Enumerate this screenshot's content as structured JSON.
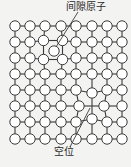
{
  "labels": {
    "interstitial": "间隙原子",
    "vacancy": "空位"
  },
  "colors": {
    "background": "#f3f3f1",
    "line": "#3a3a3a",
    "atom_fill": "#ffffff",
    "atom_stroke": "#3a3a3a"
  },
  "lattice": {
    "columns": [
      15,
      30,
      45,
      61,
      76,
      92,
      107,
      122
    ],
    "rows": [
      26,
      42,
      58,
      74,
      90,
      106,
      122,
      139
    ],
    "atom_radius": 5.2,
    "vacancy": {
      "col": 5,
      "row": 5,
      "x": 92,
      "y": 106
    },
    "interstitial": {
      "x": 54,
      "y": 51,
      "radius": 5.2
    },
    "displaced": [
      {
        "col": 2,
        "row": 1,
        "dx": -1.5,
        "dy": -1.5
      },
      {
        "col": 3,
        "row": 1,
        "dx": 1.5,
        "dy": -1.5
      },
      {
        "col": 2,
        "row": 2,
        "dx": -1.5,
        "dy": 1.5
      },
      {
        "col": 3,
        "row": 2,
        "dx": 1.5,
        "dy": 1.5
      },
      {
        "col": 4,
        "row": 5,
        "dx": 3,
        "dy": 0
      },
      {
        "col": 6,
        "row": 5,
        "dx": -3,
        "dy": 0
      },
      {
        "col": 5,
        "row": 4,
        "dx": 0,
        "dy": 3
      },
      {
        "col": 5,
        "row": 6,
        "dx": 0,
        "dy": -3
      }
    ]
  },
  "leaders": {
    "interstitial": {
      "x1": 56,
      "y1": 47,
      "x2": 78,
      "y2": 12
    },
    "vacancy": {
      "x1": 90,
      "y1": 108,
      "x2": 70,
      "y2": 147
    }
  }
}
